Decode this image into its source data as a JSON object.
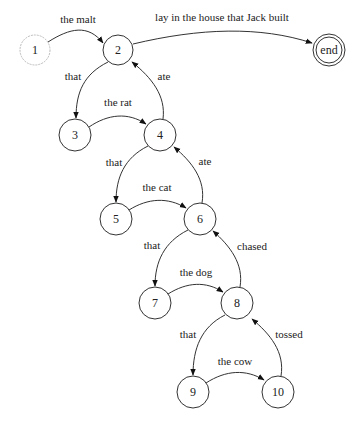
{
  "diagram": {
    "type": "finite-state-automaton",
    "nodes": [
      {
        "id": "1",
        "label": "1",
        "x": 35,
        "y": 50,
        "style": "start"
      },
      {
        "id": "2",
        "label": "2",
        "x": 118,
        "y": 50
      },
      {
        "id": "end",
        "label": "end",
        "x": 329,
        "y": 50,
        "style": "final"
      },
      {
        "id": "3",
        "label": "3",
        "x": 75,
        "y": 135
      },
      {
        "id": "4",
        "label": "4",
        "x": 160,
        "y": 135
      },
      {
        "id": "5",
        "label": "5",
        "x": 116,
        "y": 219
      },
      {
        "id": "6",
        "label": "6",
        "x": 200,
        "y": 219
      },
      {
        "id": "7",
        "label": "7",
        "x": 155,
        "y": 303
      },
      {
        "id": "8",
        "label": "8",
        "x": 237,
        "y": 303
      },
      {
        "id": "9",
        "label": "9",
        "x": 193,
        "y": 392
      },
      {
        "id": "10",
        "label": "10",
        "x": 278,
        "y": 392
      }
    ],
    "edges": [
      {
        "from": "1",
        "to": "2",
        "label": "the malt"
      },
      {
        "from": "2",
        "to": "end",
        "label": "lay in the house that Jack built"
      },
      {
        "from": "2",
        "to": "3",
        "label": "that"
      },
      {
        "from": "3",
        "to": "4",
        "label": "the rat"
      },
      {
        "from": "4",
        "to": "2",
        "label": "ate"
      },
      {
        "from": "4",
        "to": "5",
        "label": "that"
      },
      {
        "from": "5",
        "to": "6",
        "label": "the cat"
      },
      {
        "from": "6",
        "to": "4",
        "label": "ate"
      },
      {
        "from": "6",
        "to": "7",
        "label": "that"
      },
      {
        "from": "7",
        "to": "8",
        "label": "the dog"
      },
      {
        "from": "8",
        "to": "6",
        "label": "chased"
      },
      {
        "from": "8",
        "to": "9",
        "label": "that"
      },
      {
        "from": "9",
        "to": "10",
        "label": "the cow"
      },
      {
        "from": "10",
        "to": "8",
        "label": "tossed"
      }
    ]
  }
}
